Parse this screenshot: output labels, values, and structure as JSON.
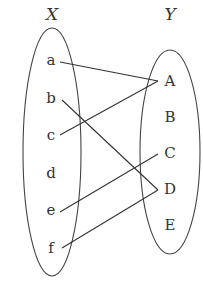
{
  "diagram": {
    "type": "mapping",
    "sets": [
      {
        "name": "X",
        "elements": [
          "a",
          "b",
          "c",
          "d",
          "e",
          "f"
        ]
      },
      {
        "name": "Y",
        "elements": [
          "A",
          "B",
          "C",
          "D",
          "E"
        ]
      }
    ],
    "mappings": [
      {
        "from": "a",
        "to": "A"
      },
      {
        "from": "b",
        "to": "D"
      },
      {
        "from": "c",
        "to": "A"
      },
      {
        "from": "e",
        "to": "C"
      },
      {
        "from": "f",
        "to": "D"
      }
    ],
    "colors": {
      "stroke": "#444444",
      "text": "#333333",
      "background": "#ffffff"
    }
  }
}
